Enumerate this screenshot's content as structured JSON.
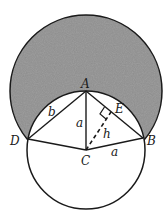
{
  "diagram": {
    "type": "geometry",
    "colors": {
      "stroke": "#1a1a1a",
      "shade": "#8c8c8c",
      "background": "#ffffff"
    },
    "points": {
      "A": {
        "label": "A",
        "x": 86,
        "y": 91
      },
      "B": {
        "label": "B",
        "x": 143,
        "y": 138
      },
      "C": {
        "label": "C",
        "x": 86,
        "y": 150
      },
      "D": {
        "label": "D",
        "x": 28,
        "y": 139
      },
      "E": {
        "label": "E",
        "x": 111,
        "y": 112
      }
    },
    "segment_labels": {
      "AD": "b",
      "AC": "a",
      "CB": "a",
      "CE": "h"
    },
    "circles": [
      {
        "name": "big-circle",
        "center": "A",
        "r": 76,
        "shaded": true
      },
      {
        "name": "small-circle",
        "center": "C",
        "r": 59,
        "shaded": false
      }
    ]
  }
}
